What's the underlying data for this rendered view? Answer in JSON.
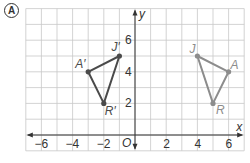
{
  "problem_label": "A",
  "colors": {
    "grid": "#c8c8c8",
    "axis": "#333333",
    "image_triangle": "#4a4a4a",
    "preimage_triangle": "#8c8c8c",
    "label_text": "#333333"
  },
  "axes": {
    "x_label": "x",
    "y_label": "y",
    "origin_label": "O",
    "x_range": [
      -7,
      7
    ],
    "y_range": [
      -1,
      8
    ],
    "x_ticks": [
      {
        "value": -6,
        "label": "−6"
      },
      {
        "value": -4,
        "label": "−4"
      },
      {
        "value": -2,
        "label": "−2"
      },
      {
        "value": 2,
        "label": "2"
      },
      {
        "value": 4,
        "label": "4"
      },
      {
        "value": 6,
        "label": "6"
      }
    ],
    "y_ticks": [
      {
        "value": 2,
        "label": "2"
      },
      {
        "value": 4,
        "label": "4"
      },
      {
        "value": 6,
        "label": "6"
      }
    ]
  },
  "triangles": [
    {
      "name": "image",
      "color_key": "image_triangle",
      "points": [
        {
          "label": "J′",
          "x": -1,
          "y": 5,
          "dx": -8,
          "dy": -5
        },
        {
          "label": "A′",
          "x": -3,
          "y": 4,
          "dx": -13,
          "dy": -4
        },
        {
          "label": "R′",
          "x": -2,
          "y": 2,
          "dx": 1,
          "dy": 12
        }
      ]
    },
    {
      "name": "preimage",
      "color_key": "preimage_triangle",
      "points": [
        {
          "label": "J",
          "x": 4,
          "y": 5,
          "dx": -8,
          "dy": -3
        },
        {
          "label": "A",
          "x": 6,
          "y": 4,
          "dx": 2,
          "dy": -3
        },
        {
          "label": "R",
          "x": 5,
          "y": 2,
          "dx": 3,
          "dy": 11
        }
      ]
    }
  ]
}
